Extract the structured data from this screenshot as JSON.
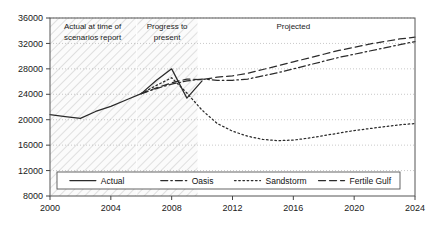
{
  "chart_data": {
    "type": "line",
    "title": "",
    "xlabel": "",
    "ylabel": "",
    "xlim": [
      2000,
      2024
    ],
    "ylim": [
      8000,
      36000
    ],
    "grid": true,
    "grid_style": "dotted-horizontal",
    "legend_position": "bottom-inside",
    "x_ticks": [
      2000,
      2004,
      2008,
      2012,
      2016,
      2020,
      2024
    ],
    "y_ticks": [
      8000,
      12000,
      16000,
      20000,
      24000,
      28000,
      32000,
      36000
    ],
    "x_tick_labels": [
      "2000",
      "2004",
      "2008",
      "2012",
      "2016",
      "2020",
      "2024"
    ],
    "y_tick_labels": [
      "8000",
      "12000",
      "16000",
      "20000",
      "24000",
      "28000",
      "32000",
      "36000"
    ],
    "annotations": [
      {
        "text": "Actual at time of scenarios report",
        "lines": [
          "Actual at time of",
          "scenarios report"
        ],
        "x_range": [
          2000,
          2005.7
        ],
        "x_center": 2002.8,
        "y": 34200
      },
      {
        "text": "Progress to present",
        "lines": [
          "Progress to",
          "present"
        ],
        "x_range": [
          2005.7,
          2009.7
        ],
        "x_center": 2007.7,
        "y": 34200
      },
      {
        "text": "Projected",
        "lines": [
          "Projected"
        ],
        "x_range": [
          2009.7,
          2024
        ],
        "x_center": 2016.0,
        "y": 34200
      }
    ],
    "shaded_bands": [
      {
        "name": "actual-at-time-of-report-band",
        "x_range": [
          2000,
          2005.7
        ],
        "pattern": "diagonal-hatch"
      },
      {
        "name": "progress-to-present-band",
        "x_range": [
          2005.7,
          2009.7
        ],
        "pattern": "diagonal-hatch"
      }
    ],
    "series": [
      {
        "name": "Actual",
        "style": "solid",
        "color": "#2b2b2b",
        "x": [
          2000,
          2001,
          2002,
          2003,
          2004,
          2005,
          2006,
          2007,
          2008,
          2009,
          2010
        ],
        "values": [
          20800,
          20500,
          20200,
          21300,
          22100,
          23100,
          24100,
          26200,
          28000,
          23400,
          26100
        ]
      },
      {
        "name": "Oasis",
        "style": "dash-dot",
        "color": "#2b2b2b",
        "x": [
          2006,
          2007,
          2008,
          2009,
          2010,
          2011,
          2012,
          2013,
          2014,
          2015,
          2016,
          2017,
          2018,
          2019,
          2020,
          2021,
          2022,
          2023,
          2024
        ],
        "values": [
          24100,
          24900,
          25600,
          26100,
          26400,
          26200,
          26200,
          26400,
          26900,
          27400,
          28000,
          28600,
          29200,
          29800,
          30300,
          30800,
          31300,
          31800,
          32300
        ]
      },
      {
        "name": "Sandstorm",
        "style": "dotted",
        "color": "#2b2b2b",
        "x": [
          2006,
          2007,
          2008,
          2009,
          2010,
          2011,
          2012,
          2013,
          2014,
          2015,
          2016,
          2017,
          2018,
          2019,
          2020,
          2021,
          2022,
          2023,
          2024
        ],
        "values": [
          24100,
          25400,
          26600,
          24200,
          21500,
          19400,
          18200,
          17400,
          16900,
          16700,
          16800,
          17100,
          17500,
          17900,
          18300,
          18600,
          18900,
          19200,
          19400
        ]
      },
      {
        "name": "Fertile Gulf",
        "style": "dashed",
        "color": "#2b2b2b",
        "x": [
          2006,
          2007,
          2008,
          2009,
          2010,
          2011,
          2012,
          2013,
          2014,
          2015,
          2016,
          2017,
          2018,
          2019,
          2020,
          2021,
          2022,
          2023,
          2024
        ],
        "values": [
          24100,
          25000,
          25800,
          26400,
          26300,
          26700,
          26900,
          27300,
          27900,
          28500,
          29100,
          29700,
          30300,
          30900,
          31400,
          31900,
          32300,
          32700,
          33000
        ]
      }
    ],
    "legend": [
      {
        "label": "Actual",
        "style": "solid"
      },
      {
        "label": "Oasis",
        "style": "dash-dot"
      },
      {
        "label": "Sandstorm",
        "style": "dotted"
      },
      {
        "label": "Fertile Gulf",
        "style": "dashed"
      }
    ]
  }
}
